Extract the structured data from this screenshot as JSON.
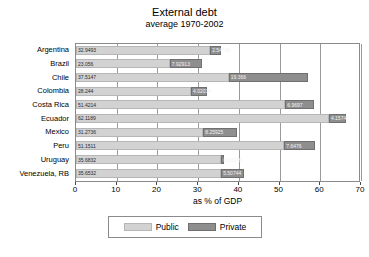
{
  "chart_data": {
    "type": "bar",
    "orientation": "horizontal",
    "stacked": true,
    "title": "External debt",
    "subtitle": "average 1970-2002",
    "xlabel": "as % of GDP",
    "ylabel": "",
    "xlim": [
      0,
      70
    ],
    "xticks": [
      0,
      10,
      20,
      30,
      40,
      50,
      60,
      70
    ],
    "grid": true,
    "legend_position": "bottom",
    "categories": [
      "Argentina",
      "Brazil",
      "Chile",
      "Colombia",
      "Costa Rica",
      "Ecuador",
      "Mexico",
      "Peru",
      "Uruguay",
      "Venezuela, RB"
    ],
    "series": [
      {
        "name": "Public",
        "color": "#d2d2d2",
        "values": [
          32.9493,
          23.056,
          37.5147,
          28.244,
          51.4214,
          62.1189,
          31.2736,
          51.1511,
          35.6832,
          35.6532
        ],
        "labels": [
          "32.9493",
          "23.056",
          "37.5147",
          "28.244",
          "51.4214",
          "62.1189",
          "31.2736",
          "51.1511",
          "35.6832",
          "35.6532"
        ]
      },
      {
        "name": "Private",
        "color": "#8e8e8e",
        "values": [
          2.54759,
          7.92913,
          19.366,
          4.02036,
          6.9697,
          4.15745,
          8.25925,
          7.6476,
          0.63978,
          5.50744
        ],
        "labels": [
          "2.54759",
          "7.92913",
          "19.366",
          "4.02036",
          "6.9697",
          "4.15745",
          "8.25925",
          "7.6476",
          "0.63978",
          "5.50744"
        ]
      }
    ]
  }
}
